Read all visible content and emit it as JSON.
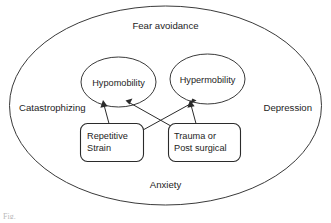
{
  "diagram": {
    "outer_region": {
      "name": "psychosocial-context-ellipse",
      "labels": {
        "top": "Fear avoidance",
        "left": "Catastrophizing",
        "right": "Depression",
        "bottom": "Anxiety"
      }
    },
    "nodes": [
      {
        "id": "hypomobility",
        "label": "Hypomobility",
        "shape": "ellipse"
      },
      {
        "id": "hypermobility",
        "label": "Hypermobility",
        "shape": "ellipse"
      },
      {
        "id": "repetitive-strain",
        "label_lines": [
          "Repetitive",
          "Strain"
        ],
        "shape": "rounded-rect"
      },
      {
        "id": "trauma-post-surgical",
        "label_lines": [
          "Trauma or",
          "Post surgical"
        ],
        "shape": "rounded-rect"
      }
    ],
    "edges": [
      {
        "from": "repetitive-strain",
        "to": "hypomobility",
        "style": "arrow"
      },
      {
        "from": "repetitive-strain",
        "to": "hypermobility",
        "style": "arrow"
      },
      {
        "from": "trauma-post-surgical",
        "to": "hypomobility",
        "style": "arrow"
      },
      {
        "from": "trauma-post-surgical",
        "to": "hypermobility",
        "style": "arrow"
      }
    ],
    "colors": {
      "stroke": "#2b2b2b",
      "outer_stroke": "#3a3a3a",
      "text": "#1d1d1d",
      "background": "#ffffff"
    },
    "caption_fragment": "Fig."
  }
}
